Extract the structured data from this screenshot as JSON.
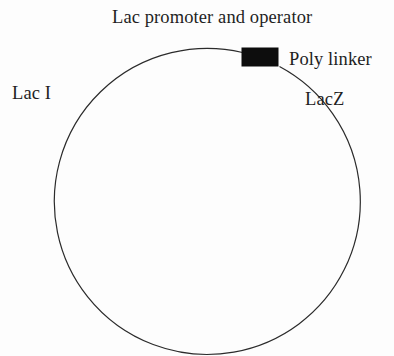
{
  "figure": {
    "kind": "plasmid-map",
    "background_color": "#fdfdfd",
    "line_color": "#2b2b2b",
    "feature_color": "#0d0d0d"
  },
  "circle": {
    "name": "plasmid-backbone",
    "center_x": 180,
    "center_y": 189,
    "radius": 153,
    "stroke_width": 1.2
  },
  "features": [
    {
      "id": "poly-linker-block",
      "shape": "rectangle",
      "x": 242,
      "y": 48,
      "width": 36,
      "height": 18,
      "fill": "#0d0d0d"
    }
  ],
  "labels": {
    "promoter": "Lac promoter and operator",
    "poly_linker": "Poly linker",
    "lacz": "LacZ",
    "laci": "Lac I"
  }
}
